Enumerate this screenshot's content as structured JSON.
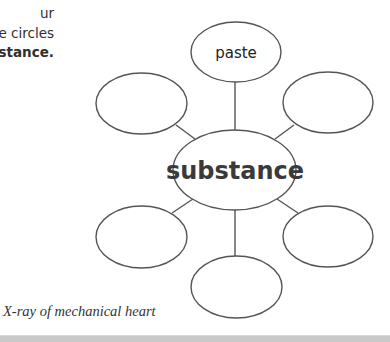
{
  "instructions": {
    "lines": [
      {
        "text": "ur",
        "bold": false
      },
      {
        "text": "e circles",
        "bold": false
      },
      {
        "text": "bstance.",
        "bold": true
      }
    ]
  },
  "word_web": {
    "center": {
      "label": "substance"
    },
    "nodes": [
      {
        "position": "top",
        "label": "paste"
      },
      {
        "position": "upper-left",
        "label": ""
      },
      {
        "position": "upper-right",
        "label": ""
      },
      {
        "position": "lower-left",
        "label": ""
      },
      {
        "position": "lower-right",
        "label": ""
      },
      {
        "position": "bottom",
        "label": ""
      }
    ],
    "colors": {
      "stroke": "#555555",
      "center_text": "#3a3a3a"
    }
  },
  "caption": "X-ray of  mechanical heart"
}
